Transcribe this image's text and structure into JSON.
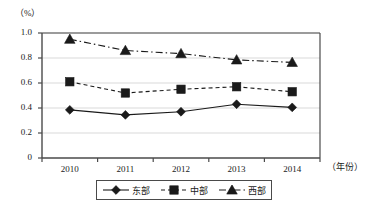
{
  "chart_data": {
    "type": "line",
    "title": "",
    "xlabel": "（年份）",
    "ylabel": "（%）",
    "categories": [
      "2010",
      "2011",
      "2012",
      "2013",
      "2014"
    ],
    "x": [
      2010,
      2011,
      2012,
      2013,
      2014
    ],
    "ylim": [
      0,
      1.0
    ],
    "y_ticks": [
      "0",
      "0.2",
      "0.4",
      "0.6",
      "0.8",
      "1.0"
    ],
    "y_tick_values": [
      0,
      0.2,
      0.4,
      0.6,
      0.8,
      1.0
    ],
    "grid": true,
    "legend_position": "bottom",
    "series": [
      {
        "name": "东部",
        "marker": "diamond",
        "line_style": "solid",
        "color": "#1a1a1a",
        "values": [
          0.385,
          0.345,
          0.37,
          0.43,
          0.405
        ]
      },
      {
        "name": "中部",
        "marker": "square",
        "line_style": "dotted",
        "color": "#1a1a1a",
        "values": [
          0.61,
          0.52,
          0.55,
          0.57,
          0.53
        ]
      },
      {
        "name": "西部",
        "marker": "triangle",
        "line_style": "dashdot",
        "color": "#1a1a1a",
        "values": [
          0.95,
          0.86,
          0.835,
          0.785,
          0.765
        ]
      }
    ]
  },
  "axes": {
    "y_unit_label": "（%）",
    "x_unit_label": "（年份）"
  },
  "legend": {
    "items": [
      {
        "label": "东部"
      },
      {
        "label": "中部"
      },
      {
        "label": "西部"
      }
    ]
  },
  "colors": {
    "ink": "#1a1a1a",
    "axis": "#4a4a4a",
    "grid": "#d9d9d9",
    "background": "#ffffff"
  }
}
